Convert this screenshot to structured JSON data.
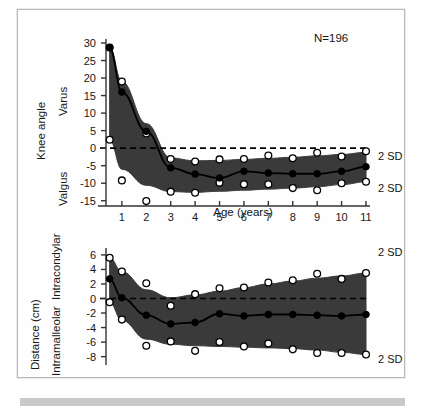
{
  "figure": {
    "sample_size_label": "N=196",
    "band_color": "#3a3a3a",
    "line_color": "#000000",
    "marker_mean_color": "#000000",
    "marker_sd_color": "#ffffff",
    "frame_color": "#b9b9b9",
    "bottom_bar_color": "#c9c9c9"
  },
  "chart_data": [
    {
      "type": "line",
      "id": "knee-angle",
      "title": "",
      "xlabel": "Age (years)",
      "ylabel": "Knee angle",
      "ylabel_top": "Varus",
      "ylabel_bottom": "Valgus",
      "xlim": [
        0.35,
        11.0
      ],
      "ylim": [
        -16.5,
        30.0
      ],
      "yticks": [
        30,
        25,
        20,
        15,
        10,
        5,
        0,
        -5,
        -10,
        -15
      ],
      "ytick_labels": [
        "30",
        "25",
        "20",
        "15",
        "10",
        "5",
        "0",
        "-5",
        "-10",
        "-15"
      ],
      "xticks": [
        1,
        2,
        3,
        4,
        5,
        6,
        7,
        8,
        9,
        10,
        11
      ],
      "xtick_labels": [
        "1",
        "2",
        "3",
        "4",
        "5",
        "6",
        "7",
        "8",
        "9",
        "10",
        "11"
      ],
      "grid": false,
      "zero_line": 0,
      "zero_line_style": "dashed",
      "annotations": [
        {
          "text": "N=196",
          "x": 9.3,
          "y": 27.5
        },
        {
          "text": "2 SD",
          "x": 11.3,
          "y": -1.0
        },
        {
          "text": "2 SD",
          "x": 11.3,
          "y": -9.8
        }
      ],
      "series": [
        {
          "name": "Mean knee angle",
          "marker": "filled-circle",
          "x": [
            0.5,
            1.0,
            2.0,
            3.0,
            4.0,
            5.0,
            6.0,
            7.0,
            8.0,
            9.0,
            10.0,
            11.0
          ],
          "values": [
            28.7,
            16.0,
            4.8,
            -5.6,
            -7.4,
            -8.5,
            -6.6,
            -7.1,
            -7.3,
            -7.3,
            -6.6,
            -5.3
          ]
        },
        {
          "name": "Upper 2 SD",
          "marker": "open-circle",
          "x": [
            0.5,
            1.0,
            2.0,
            3.0,
            4.0,
            5.0,
            6.0,
            7.0,
            8.0,
            9.0,
            10.0,
            11.0
          ],
          "values": [
            28.7,
            19.0,
            4.2,
            -3.1,
            -3.8,
            -3.2,
            -3.1,
            -2.1,
            -2.9,
            -1.3,
            -2.4,
            -0.9
          ]
        },
        {
          "name": "Lower 2 SD",
          "marker": "open-circle",
          "x": [
            0.5,
            1.0,
            2.0,
            3.0,
            4.0,
            5.0,
            6.0,
            7.0,
            8.0,
            9.0,
            10.0,
            11.0
          ],
          "values": [
            2.4,
            -9.2,
            -15.1,
            -12.4,
            -12.7,
            -9.9,
            -10.3,
            -10.3,
            -11.4,
            -12.0,
            -10.0,
            -9.6
          ]
        },
        {
          "name": "Band upper boundary",
          "marker": "none",
          "x": [
            0.5,
            1.0,
            2.0,
            3.0,
            4.0,
            5.0,
            6.0,
            7.0,
            8.0,
            9.0,
            10.0,
            11.0
          ],
          "values": [
            28.7,
            19.0,
            7.0,
            -2.8,
            -3.6,
            -3.5,
            -3.2,
            -2.9,
            -2.6,
            -2.2,
            -1.8,
            -1.2
          ]
        },
        {
          "name": "Band lower boundary",
          "marker": "none",
          "x": [
            0.5,
            1.0,
            2.0,
            3.0,
            4.0,
            5.0,
            6.0,
            7.0,
            8.0,
            9.0,
            10.0,
            11.0
          ],
          "values": [
            2.4,
            -6.0,
            -10.6,
            -12.4,
            -12.6,
            -12.3,
            -12.0,
            -11.7,
            -11.4,
            -11.0,
            -10.4,
            -9.6
          ]
        }
      ]
    },
    {
      "type": "line",
      "id": "distance",
      "title": "",
      "xlabel": "",
      "ylabel": "Distance (cm)",
      "ylabel_top": "Intracondylar",
      "ylabel_bottom": "Intramalleolar",
      "xlim": [
        0.35,
        11.0
      ],
      "ylim": [
        -8.6,
        6.4
      ],
      "yticks": [
        6,
        4,
        2,
        0,
        -2,
        -4,
        -6,
        -8
      ],
      "ytick_labels": [
        "6",
        "4",
        "2",
        "0",
        "-2",
        "-4",
        "-6",
        "-8"
      ],
      "xticks": [],
      "xtick_labels": [],
      "grid": false,
      "zero_line": 0,
      "zero_line_style": "dashed",
      "annotations": [
        {
          "text": "2 SD",
          "x": 11.3,
          "y": 3.4
        },
        {
          "text": "2 SD",
          "x": 11.3,
          "y": -7.7
        }
      ],
      "series": [
        {
          "name": "Mean distance",
          "marker": "filled-circle",
          "x": [
            0.5,
            1.0,
            2.0,
            3.0,
            4.0,
            5.0,
            6.0,
            7.0,
            8.0,
            9.0,
            10.0,
            11.0
          ],
          "values": [
            2.7,
            0.1,
            -2.3,
            -3.5,
            -3.3,
            -2.1,
            -2.4,
            -2.2,
            -2.2,
            -2.3,
            -2.4,
            -2.2
          ]
        },
        {
          "name": "Upper 2 SD",
          "marker": "open-circle",
          "x": [
            0.5,
            1.0,
            2.0,
            3.0,
            4.0,
            5.0,
            6.0,
            7.0,
            8.0,
            9.0,
            10.0,
            11.0
          ],
          "values": [
            5.6,
            3.7,
            2.1,
            -1.0,
            0.6,
            1.4,
            1.5,
            2.2,
            2.5,
            3.4,
            2.7,
            3.5
          ]
        },
        {
          "name": "Lower 2 SD",
          "marker": "open-circle",
          "x": [
            0.5,
            1.0,
            2.0,
            3.0,
            4.0,
            5.0,
            6.0,
            7.0,
            8.0,
            9.0,
            10.0,
            11.0
          ],
          "values": [
            -0.5,
            -2.9,
            -6.5,
            -5.9,
            -7.2,
            -6.0,
            -6.6,
            -6.2,
            -7.0,
            -7.5,
            -7.5,
            -7.7
          ]
        },
        {
          "name": "Band upper boundary",
          "marker": "none",
          "x": [
            0.5,
            1.0,
            2.0,
            3.0,
            4.0,
            5.0,
            6.0,
            7.0,
            8.0,
            9.0,
            10.0,
            11.0
          ],
          "values": [
            5.6,
            3.7,
            1.2,
            0.1,
            0.5,
            1.0,
            1.5,
            2.0,
            2.4,
            2.8,
            3.1,
            3.5
          ]
        },
        {
          "name": "Band lower boundary",
          "marker": "none",
          "x": [
            0.5,
            1.0,
            2.0,
            3.0,
            4.0,
            5.0,
            6.0,
            7.0,
            8.0,
            9.0,
            10.0,
            11.0
          ],
          "values": [
            -0.5,
            -3.0,
            -5.6,
            -6.3,
            -6.5,
            -6.6,
            -6.7,
            -6.8,
            -6.9,
            -7.1,
            -7.4,
            -7.7
          ]
        }
      ]
    }
  ]
}
